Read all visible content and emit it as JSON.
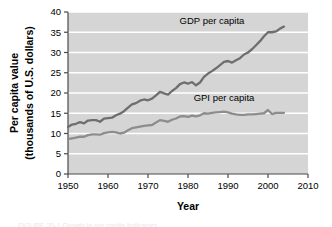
{
  "figure": {
    "caption_partial": "FIGURE 20-1  Growth in per capita indicators"
  },
  "chart_data": {
    "type": "line",
    "title": "",
    "xlabel": "Year",
    "ylabel_line1": "Per capita value",
    "ylabel_line2": "(thousands of U.S. dollars)",
    "xlim": [
      1950,
      2010
    ],
    "ylim": [
      0,
      40
    ],
    "xticks": [
      1950,
      1960,
      1970,
      1980,
      1990,
      2000,
      2010
    ],
    "yticks": [
      0,
      5,
      10,
      15,
      20,
      25,
      30,
      35,
      40
    ],
    "xtick_labels": [
      "1950",
      "1960",
      "1970",
      "1980",
      "1990",
      "2000",
      "2010"
    ],
    "ytick_labels": [
      "0",
      "5",
      "10",
      "15",
      "20",
      "25",
      "30",
      "35",
      "40"
    ],
    "grid": "horizontal-white",
    "plot_bg": "#d5d5d5",
    "gridline_color": "#ffffff",
    "legend_position": "inline-annotations",
    "series": [
      {
        "name": "GDP per capita",
        "label": "GDP per capita",
        "color": "#6e6e6e",
        "label_x": 1986,
        "label_y": 37.0,
        "x": [
          1950,
          1951,
          1952,
          1953,
          1954,
          1955,
          1956,
          1957,
          1958,
          1959,
          1960,
          1961,
          1962,
          1963,
          1964,
          1965,
          1966,
          1967,
          1968,
          1969,
          1970,
          1971,
          1972,
          1973,
          1974,
          1975,
          1976,
          1977,
          1978,
          1979,
          1980,
          1981,
          1982,
          1983,
          1984,
          1985,
          1986,
          1987,
          1988,
          1989,
          1990,
          1991,
          1992,
          1993,
          1994,
          1995,
          1996,
          1997,
          1998,
          1999,
          2000,
          2001,
          2002,
          2003,
          2004
        ],
        "values": [
          11.6,
          12.2,
          12.4,
          12.8,
          12.5,
          13.2,
          13.3,
          13.3,
          12.9,
          13.7,
          13.8,
          13.9,
          14.5,
          14.9,
          15.5,
          16.4,
          17.2,
          17.5,
          18.1,
          18.4,
          18.2,
          18.6,
          19.4,
          20.3,
          19.9,
          19.6,
          20.5,
          21.2,
          22.2,
          22.6,
          22.3,
          22.7,
          21.9,
          22.6,
          24.0,
          24.8,
          25.4,
          26.1,
          26.9,
          27.7,
          27.9,
          27.5,
          28.1,
          28.6,
          29.5,
          30.0,
          30.8,
          31.8,
          32.8,
          34.0,
          35.0,
          35.0,
          35.2,
          35.9,
          36.4
        ]
      },
      {
        "name": "GPI per capita",
        "label": "GPI per capita",
        "color": "#8d8d8d",
        "label_x": 1989,
        "label_y": 18.1,
        "x": [
          1950,
          1951,
          1952,
          1953,
          1954,
          1955,
          1956,
          1957,
          1958,
          1959,
          1960,
          1961,
          1962,
          1963,
          1964,
          1965,
          1966,
          1967,
          1968,
          1969,
          1970,
          1971,
          1972,
          1973,
          1974,
          1975,
          1976,
          1977,
          1978,
          1979,
          1980,
          1981,
          1982,
          1983,
          1984,
          1985,
          1986,
          1987,
          1988,
          1989,
          1990,
          1991,
          1992,
          1993,
          1994,
          1995,
          1996,
          1997,
          1998,
          1999,
          2000,
          2001,
          2002,
          2003,
          2004
        ],
        "values": [
          8.6,
          8.8,
          9.0,
          9.2,
          9.2,
          9.6,
          9.8,
          9.8,
          9.7,
          10.1,
          10.3,
          10.4,
          10.3,
          10.0,
          10.2,
          10.8,
          11.3,
          11.5,
          11.7,
          11.9,
          12.0,
          12.1,
          12.7,
          13.3,
          13.1,
          12.9,
          13.4,
          13.7,
          14.2,
          14.3,
          14.1,
          14.4,
          14.2,
          14.5,
          15.0,
          14.9,
          15.1,
          15.2,
          15.3,
          15.4,
          15.2,
          14.9,
          14.7,
          14.6,
          14.6,
          14.7,
          14.7,
          14.8,
          14.9,
          15.0,
          15.8,
          14.8,
          15.1,
          15.1,
          15.1
        ]
      }
    ]
  }
}
